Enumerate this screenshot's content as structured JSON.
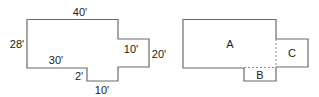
{
  "figure_left": {
    "title": "Floor plan with dimensions",
    "dimensions": {
      "top": "40'",
      "left": "28'",
      "bottom_left": "30'",
      "step": "2'",
      "bottom_notch": "10'",
      "right_inner": "10'",
      "right": "20'"
    }
  },
  "figure_right": {
    "title": "Floor plan divided into regions",
    "regions": {
      "a": "A",
      "b": "B",
      "c": "C"
    }
  },
  "colors": {
    "stroke": "#6b6b6b",
    "text": "#222222",
    "divider": "#8a8a8a"
  }
}
